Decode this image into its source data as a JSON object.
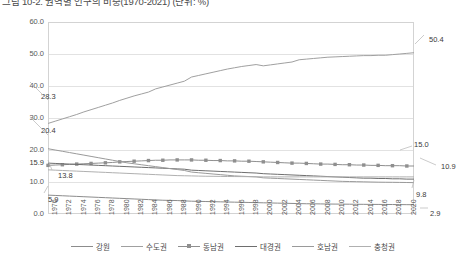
{
  "title": "그림 10-2. 권역별 인구의 비중(1970-2021)  (단위: %)",
  "chart_data": {
    "type": "line",
    "title": "그림 10-2. 권역별 인구의 비중(1970-2021)  (단위: %)",
    "xlabel": "",
    "ylabel": "",
    "ylim": [
      0.0,
      60.0
    ],
    "ytick_labels": [
      "0.0",
      "10.0",
      "20.0",
      "30.0",
      "40.0",
      "50.0",
      "60.0"
    ],
    "ytick_values": [
      0,
      10,
      20,
      30,
      40,
      50,
      60
    ],
    "extra_ytick_label": "15.9",
    "extra_ytick_value": 15.9,
    "grid": true,
    "legend_position": "bottom",
    "x": [
      1970,
      1971,
      1972,
      1973,
      1974,
      1975,
      1976,
      1977,
      1978,
      1979,
      1980,
      1981,
      1982,
      1983,
      1984,
      1985,
      1986,
      1987,
      1988,
      1989,
      1990,
      1991,
      1992,
      1993,
      1994,
      1995,
      1996,
      1997,
      1998,
      1999,
      2000,
      2001,
      2002,
      2003,
      2004,
      2005,
      2006,
      2007,
      2008,
      2009,
      2010,
      2011,
      2012,
      2013,
      2014,
      2015,
      2016,
      2017,
      2018,
      2019,
      2020,
      2021
    ],
    "xtick_labels": [
      "1970",
      "1972",
      "1974",
      "1976",
      "1978",
      "1980",
      "1982",
      "1984",
      "1986",
      "1988",
      "1990",
      "1992",
      "1994",
      "1996",
      "1998",
      "2000",
      "2002",
      "2004",
      "2006",
      "2008",
      "2010",
      "2012",
      "2014",
      "2016",
      "2018",
      "2020"
    ],
    "series": [
      {
        "name": "강원",
        "color": "#8c8c8c",
        "marker": "none",
        "start_label": "5.9",
        "end_label": "2.9",
        "values": [
          5.9,
          5.8,
          5.7,
          5.6,
          5.5,
          5.4,
          5.3,
          5.2,
          5.1,
          5.0,
          4.9,
          4.8,
          4.7,
          4.6,
          4.5,
          4.4,
          4.3,
          4.25,
          4.2,
          4.1,
          4.0,
          3.95,
          3.9,
          3.85,
          3.8,
          3.75,
          3.7,
          3.65,
          3.6,
          3.55,
          3.5,
          3.45,
          3.4,
          3.35,
          3.3,
          3.25,
          3.2,
          3.18,
          3.15,
          3.12,
          3.1,
          3.08,
          3.06,
          3.04,
          3.02,
          3.0,
          2.99,
          2.98,
          2.96,
          2.94,
          2.92,
          2.9
        ]
      },
      {
        "name": "수도권",
        "color": "#a0a0a0",
        "marker": "none",
        "start_label": "28.3",
        "end_label": "50.4",
        "values": [
          28.3,
          29.0,
          29.7,
          30.4,
          31.1,
          31.9,
          32.6,
          33.3,
          34.0,
          34.7,
          35.5,
          36.2,
          36.9,
          37.5,
          38.1,
          39.1,
          39.7,
          40.3,
          40.9,
          41.5,
          42.8,
          43.3,
          43.8,
          44.3,
          44.8,
          45.3,
          45.7,
          46.1,
          46.4,
          46.7,
          46.3,
          46.6,
          46.9,
          47.2,
          47.5,
          48.2,
          48.4,
          48.6,
          48.8,
          49.0,
          49.1,
          49.2,
          49.3,
          49.4,
          49.5,
          49.5,
          49.6,
          49.6,
          49.8,
          50.0,
          50.2,
          50.4
        ]
      },
      {
        "name": "동남권",
        "color": "#8f8f8f",
        "marker": "square",
        "start_label": "",
        "end_label": "15.0",
        "values": [
          15.2,
          15.3,
          15.4,
          15.5,
          15.6,
          15.7,
          15.8,
          15.9,
          16.0,
          16.1,
          16.3,
          16.4,
          16.5,
          16.6,
          16.7,
          16.8,
          16.8,
          16.9,
          16.9,
          16.9,
          16.9,
          16.8,
          16.8,
          16.7,
          16.7,
          16.6,
          16.6,
          16.5,
          16.5,
          16.4,
          16.3,
          16.2,
          16.1,
          16.0,
          15.9,
          15.9,
          15.8,
          15.7,
          15.6,
          15.6,
          15.5,
          15.4,
          15.4,
          15.3,
          15.3,
          15.2,
          15.2,
          15.1,
          15.1,
          15.1,
          15.0,
          15.0
        ]
      },
      {
        "name": "대경권",
        "color": "#6e6e6e",
        "marker": "none",
        "start_label": "15.9",
        "end_label": "10.9",
        "values": [
          15.9,
          15.8,
          15.7,
          15.6,
          15.5,
          15.4,
          15.3,
          15.2,
          15.1,
          15.0,
          14.9,
          14.8,
          14.7,
          14.6,
          14.5,
          14.4,
          14.3,
          14.2,
          14.1,
          14.0,
          13.7,
          13.6,
          13.5,
          13.4,
          13.3,
          13.2,
          13.1,
          13.0,
          12.9,
          12.8,
          12.6,
          12.5,
          12.4,
          12.3,
          12.2,
          12.1,
          12.0,
          11.9,
          11.8,
          11.7,
          11.6,
          11.5,
          11.4,
          11.3,
          11.2,
          11.2,
          11.1,
          11.1,
          11.0,
          11.0,
          10.9,
          10.9
        ]
      },
      {
        "name": "호남권",
        "color": "#9a9a9a",
        "marker": "none",
        "start_label": "20.4",
        "end_label": "9.8",
        "values": [
          20.4,
          20.0,
          19.6,
          19.2,
          18.8,
          18.4,
          18.0,
          17.6,
          17.2,
          16.8,
          16.4,
          16.0,
          15.7,
          15.4,
          15.1,
          14.8,
          14.5,
          14.2,
          13.9,
          13.6,
          13.1,
          12.9,
          12.7,
          12.5,
          12.3,
          12.1,
          11.9,
          11.8,
          11.7,
          11.6,
          11.3,
          11.2,
          11.1,
          11.0,
          10.9,
          10.8,
          10.7,
          10.6,
          10.5,
          10.4,
          10.3,
          10.2,
          10.15,
          10.1,
          10.05,
          10.0,
          9.95,
          9.92,
          9.9,
          9.87,
          9.84,
          9.8
        ]
      },
      {
        "name": "충청권",
        "color": "#b0b0b0",
        "marker": "none",
        "start_label": "13.8",
        "end_label": "",
        "values": [
          13.8,
          13.7,
          13.6,
          13.5,
          13.4,
          13.3,
          13.2,
          13.1,
          13.0,
          12.9,
          12.8,
          12.7,
          12.6,
          12.5,
          12.4,
          12.3,
          12.2,
          12.1,
          12.0,
          11.95,
          11.9,
          11.85,
          11.8,
          11.78,
          11.75,
          11.72,
          11.7,
          11.68,
          11.66,
          11.64,
          11.6,
          11.6,
          11.6,
          11.6,
          11.6,
          11.6,
          11.6,
          11.6,
          11.6,
          11.6,
          11.6,
          11.6,
          11.6,
          11.6,
          11.6,
          11.6,
          11.6,
          11.6,
          11.6,
          11.6,
          11.6,
          11.6
        ]
      }
    ]
  },
  "annotations": {
    "left": [
      {
        "text": "28.3",
        "x": 41,
        "y": 92
      },
      {
        "text": "20.4",
        "x": 41,
        "y": 126
      },
      {
        "text": "13.8",
        "x": 58,
        "y": 171
      },
      {
        "text": "5.9",
        "x": 48,
        "y": 195
      }
    ],
    "right": [
      {
        "text": "50.4",
        "x": 429,
        "y": 35
      },
      {
        "text": "15.0",
        "x": 414,
        "y": 140
      },
      {
        "text": "10.9",
        "x": 441,
        "y": 162
      },
      {
        "text": "9.8",
        "x": 416,
        "y": 190
      },
      {
        "text": "2.9",
        "x": 430,
        "y": 209
      }
    ]
  }
}
